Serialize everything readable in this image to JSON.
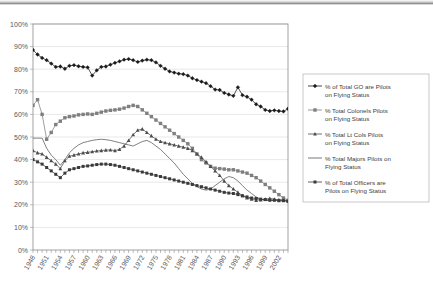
{
  "chart_data": {
    "type": "line",
    "title": "",
    "xlabel": "",
    "ylabel": "",
    "ylim": [
      0,
      100
    ],
    "ytick_labels": [
      "0%",
      "10%",
      "20%",
      "30%",
      "40%",
      "50%",
      "60%",
      "70%",
      "80%",
      "90%",
      "100%"
    ],
    "ytick_values": [
      0,
      10,
      20,
      30,
      40,
      50,
      60,
      70,
      80,
      90,
      100
    ],
    "grid": true,
    "legend_position": "right",
    "x_start": 1948,
    "x_end": 2004,
    "x": [
      1948,
      1949,
      1950,
      1951,
      1952,
      1953,
      1954,
      1955,
      1956,
      1957,
      1958,
      1959,
      1960,
      1961,
      1962,
      1963,
      1964,
      1965,
      1966,
      1967,
      1968,
      1969,
      1970,
      1971,
      1972,
      1973,
      1974,
      1975,
      1976,
      1977,
      1978,
      1979,
      1980,
      1981,
      1982,
      1983,
      1984,
      1985,
      1986,
      1987,
      1988,
      1989,
      1990,
      1991,
      1992,
      1993,
      1994,
      1995,
      1996,
      1997,
      1998,
      1999,
      2000,
      2001,
      2002,
      2003,
      2004
    ],
    "xtick_labels": [
      "1948",
      "1951",
      "1954",
      "1957",
      "1960",
      "1963",
      "1966",
      "1969",
      "1972",
      "1975",
      "1978",
      "1981",
      "1984",
      "1987",
      "1990",
      "1993",
      "1996",
      "1999",
      "2002"
    ],
    "series": [
      {
        "name": "% of Total GO are Pilots on Flying Status",
        "marker": "diamond",
        "color": "#1a1a1a",
        "values": [
          88.5,
          86.5,
          85.0,
          84.0,
          82.5,
          81.0,
          81.2,
          80.2,
          81.5,
          81.8,
          81.3,
          81.0,
          80.8,
          77.2,
          79.5,
          81.0,
          81.2,
          82.0,
          82.8,
          83.5,
          84.2,
          84.5,
          84.0,
          83.2,
          83.8,
          84.2,
          84.0,
          83.0,
          81.5,
          80.2,
          79.0,
          78.5,
          78.0,
          77.8,
          77.2,
          76.0,
          75.2,
          74.5,
          73.8,
          72.5,
          71.0,
          70.8,
          69.5,
          68.8,
          68.2,
          72.0,
          68.5,
          67.8,
          66.5,
          64.5,
          63.5,
          62.0,
          61.5,
          61.8,
          61.5,
          61.3,
          62.5
        ]
      },
      {
        "name": "% Total Colonels Pilots on Flying Status",
        "marker": "square",
        "color": "#7f7f7f",
        "values": [
          64.0,
          66.5,
          60.0,
          49.0,
          52.0,
          55.5,
          57.0,
          58.5,
          59.0,
          59.3,
          59.8,
          60.0,
          60.2,
          60.0,
          60.5,
          61.0,
          61.5,
          61.8,
          62.0,
          62.3,
          62.8,
          63.5,
          64.0,
          63.5,
          62.0,
          60.5,
          59.0,
          57.5,
          56.0,
          54.5,
          53.0,
          51.5,
          50.0,
          48.5,
          47.0,
          45.0,
          42.5,
          40.0,
          38.5,
          37.0,
          36.2,
          36.0,
          35.8,
          35.5,
          35.5,
          35.0,
          34.5,
          34.0,
          33.0,
          32.0,
          30.5,
          29.0,
          27.5,
          26.0,
          24.5,
          23.0,
          22.0
        ]
      },
      {
        "name": "% Total Lt Cols Pilots on Flying Status",
        "marker": "triangle",
        "color": "#4d4d4d",
        "values": [
          44.0,
          43.0,
          42.5,
          41.0,
          39.5,
          38.0,
          36.0,
          39.5,
          41.5,
          42.0,
          42.5,
          43.0,
          43.2,
          43.5,
          43.8,
          44.0,
          44.2,
          44.3,
          44.0,
          44.5,
          46.0,
          48.5,
          51.0,
          53.0,
          53.5,
          52.0,
          50.5,
          49.0,
          48.0,
          47.5,
          47.0,
          46.5,
          46.0,
          45.5,
          45.0,
          44.0,
          42.5,
          41.0,
          39.0,
          37.0,
          35.0,
          33.0,
          30.5,
          28.5,
          27.0,
          25.5,
          24.0,
          23.0,
          22.5,
          22.0,
          22.2,
          22.5,
          22.8,
          22.5,
          22.2,
          22.0,
          21.8
        ]
      },
      {
        "name": "% Total Majors Pilots on Flying Status",
        "marker": "none",
        "color": "#555555",
        "values": [
          49.5,
          49.5,
          49.5,
          45.0,
          42.0,
          40.0,
          37.5,
          40.0,
          43.0,
          45.0,
          46.5,
          47.5,
          48.0,
          48.5,
          48.8,
          49.0,
          48.8,
          48.5,
          48.0,
          47.5,
          47.0,
          46.5,
          46.0,
          47.0,
          48.0,
          48.5,
          47.5,
          46.0,
          44.5,
          42.5,
          40.5,
          38.5,
          36.0,
          33.5,
          31.5,
          29.5,
          28.0,
          27.0,
          26.5,
          27.0,
          28.5,
          30.0,
          31.5,
          32.5,
          32.0,
          30.5,
          28.5,
          26.5,
          25.0,
          23.5,
          22.5,
          22.0,
          21.8,
          22.0,
          22.2,
          22.0,
          21.8
        ]
      },
      {
        "name": "% of Total Officers are Pilots on Flying Status",
        "marker": "square-small",
        "color": "#3a3a3a",
        "values": [
          40.0,
          39.0,
          38.0,
          36.5,
          35.0,
          33.5,
          32.0,
          34.0,
          35.5,
          36.0,
          36.5,
          37.0,
          37.2,
          37.5,
          37.8,
          38.0,
          38.0,
          37.8,
          37.5,
          37.0,
          36.5,
          36.0,
          35.5,
          35.0,
          34.5,
          34.0,
          33.5,
          33.0,
          32.5,
          32.0,
          31.5,
          31.0,
          30.5,
          30.0,
          29.5,
          29.0,
          28.5,
          28.0,
          27.5,
          27.0,
          26.5,
          26.0,
          25.5,
          25.2,
          25.0,
          24.5,
          24.0,
          23.5,
          23.0,
          22.8,
          22.5,
          22.3,
          22.0,
          22.0,
          21.8,
          21.8,
          21.5
        ]
      }
    ]
  },
  "legend": {
    "items": [
      {
        "label": "% of Total GO are Pilots on Flying Status",
        "marker": "diamond",
        "color": "#1a1a1a"
      },
      {
        "label": "% Total Colonels Pilots on Flying Status",
        "marker": "square",
        "color": "#7f7f7f"
      },
      {
        "label": "% Total Lt Cols Pilots on Flying Status",
        "marker": "triangle",
        "color": "#4d4d4d"
      },
      {
        "label": "% Total Majors Pilots on Flying Status",
        "marker": "none",
        "color": "#555555"
      },
      {
        "label": "% of Total Officers are Pilots on Flying Status",
        "marker": "square-small",
        "color": "#3a3a3a"
      }
    ]
  }
}
